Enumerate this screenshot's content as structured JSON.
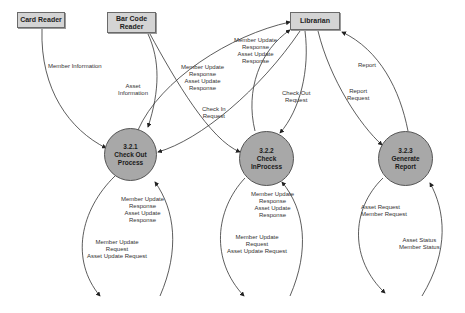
{
  "entities": {
    "card_reader": "Card Reader",
    "bar_code_reader": "Bar Code\nReader",
    "librarian": "Librarian"
  },
  "processes": [
    {
      "id": "3.2.1",
      "name": "Check Out\nProcess"
    },
    {
      "id": "3.2.2",
      "name": "Check\nInProcess"
    },
    {
      "id": "3.2.3",
      "name": "Generate\nReport"
    }
  ],
  "flows": {
    "member_information": "Member Information",
    "asset_information": "Asset\nInformation",
    "co_to_librarian": "Member Update\nResponse\nAsset Update\nResponse",
    "ci_to_librarian": "Member Update\nResponse\nAsset Update\nResponse",
    "check_in_request": "Check In\nRequest",
    "check_out_request": "Check Out\nRequest",
    "report": "Report",
    "report_request": "Report\nRequest",
    "co_loop_in": "Member Update\nResponse\nAsset Update\nResponse",
    "co_loop_out": "Member Update\nRequest\nAsset Update Request",
    "ci_loop_in": "Member Update\nResponse\nAsset Update\nResponse",
    "ci_loop_out": "Member Update\nRequest\nAsset Update Request",
    "gr_loop_out": "Asset Request\nMember Request",
    "gr_loop_in": "Asset Status\nMember Status"
  },
  "colors": {
    "entity_fill": "#d4d4d4",
    "process_fill": "#a8a8a8",
    "line": "#333333"
  }
}
